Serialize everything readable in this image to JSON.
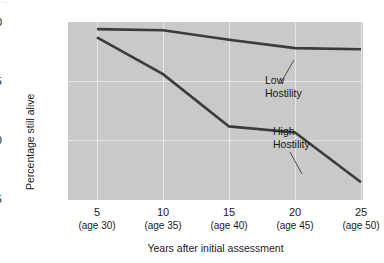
{
  "top_caption": "...",
  "chart_data": {
    "type": "line",
    "title": "",
    "xlabel": "Years after initial assessment",
    "ylabel": "Percentage still alive",
    "x": [
      5,
      10,
      15,
      20,
      25
    ],
    "xtick_labels": [
      "5",
      "10",
      "15",
      "20",
      "25"
    ],
    "xtick_sublabels": [
      "(age 30)",
      "(age 35)",
      "(age 40)",
      "(age 45)",
      "(age 50)"
    ],
    "ytick_labels": [
      "100",
      "95",
      "90",
      "85"
    ],
    "yticks": [
      100,
      95,
      90,
      85
    ],
    "ylim": [
      85,
      100
    ],
    "xlim": [
      5,
      25
    ],
    "grid": true,
    "legend_position": "inline-annotation",
    "plot_background": "#c9c9c9",
    "line_color": "#3b3b3b",
    "series": [
      {
        "name": "Low Hostility",
        "label": "Low\nHostility",
        "label_line1": "Low",
        "label_line2": "Hostility",
        "values": [
          99.4,
          99.3,
          98.5,
          97.8,
          97.7
        ]
      },
      {
        "name": "High Hostility",
        "label": "High\nHostility",
        "label_line1": "High",
        "label_line2": "Hostility",
        "values": [
          98.7,
          95.6,
          91.2,
          90.7,
          86.5
        ]
      }
    ]
  }
}
